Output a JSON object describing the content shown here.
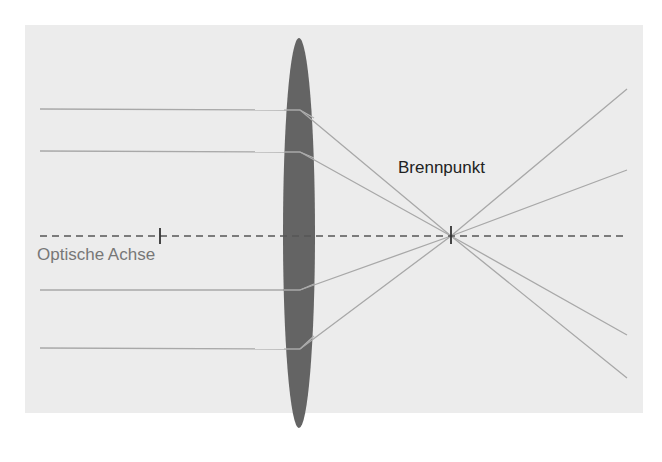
{
  "diagram": {
    "labels": {
      "optical_axis": "Optische Achse",
      "focal_point": "Brennpunkt"
    },
    "colors": {
      "background": "#ffffff",
      "panel": "#ececec",
      "lens": "#646464",
      "rays": "#a8a8a8",
      "axis": "#555555",
      "focal_label": "#222222",
      "axis_label": "#777777"
    },
    "elements": {
      "lens": {
        "type": "converging-lens",
        "cx": 299,
        "cy": 233,
        "rx": 16,
        "ry": 195
      },
      "optical_axis": {
        "style": "dashed",
        "y": 236,
        "x1": 40,
        "x2": 626
      },
      "focal_ticks": [
        {
          "name": "left-focal-point",
          "x": 160,
          "y": 236
        },
        {
          "name": "right-focal-point",
          "x": 451,
          "y": 236
        }
      ],
      "rays": [
        {
          "in_y": 109,
          "lens_x": 300,
          "focus": [
            451,
            236
          ],
          "out": [
            627,
            89
          ]
        },
        {
          "in_y": 151,
          "lens_x": 300,
          "focus": [
            451,
            236
          ],
          "out": [
            627,
            170
          ]
        },
        {
          "in_y": 290,
          "lens_x": 300,
          "focus": [
            451,
            236
          ],
          "out": [
            627,
            335
          ]
        },
        {
          "in_y": 348,
          "lens_x": 300,
          "focus": [
            451,
            236
          ],
          "out": [
            627,
            378
          ]
        }
      ]
    }
  }
}
